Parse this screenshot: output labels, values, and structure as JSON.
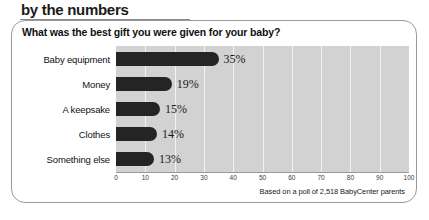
{
  "headline": "by the numbers",
  "question": "What was the best gift you were given for your baby?",
  "source_note": "Based on a poll of 2,518 BabyCenter parents",
  "chart_data": {
    "type": "bar",
    "orientation": "horizontal",
    "title": "What was the best gift you were given for your baby?",
    "xlabel": "",
    "ylabel": "",
    "xlim": [
      0,
      100
    ],
    "xticks": [
      0,
      10,
      20,
      30,
      40,
      50,
      60,
      70,
      80,
      90,
      100
    ],
    "tick_labels": [
      "0",
      "10",
      "20",
      "30",
      "40",
      "50",
      "60",
      "70",
      "80",
      "90",
      "100"
    ],
    "grid": true,
    "legend": "none",
    "bar_color": "#242424",
    "plot_background": "#d2d2d2",
    "gridline_color": "#f2f2f2",
    "categories": [
      "Baby equipment",
      "Money",
      "A keepsake",
      "Clothes",
      "Something else"
    ],
    "values": [
      35,
      19,
      15,
      14,
      13
    ],
    "value_labels": [
      "35%",
      "19%",
      "15%",
      "14%",
      "13%"
    ],
    "annotation": "Based on a poll of 2,518 BabyCenter parents"
  }
}
